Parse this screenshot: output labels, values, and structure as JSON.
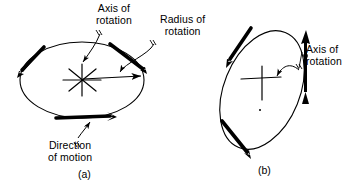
{
  "figure": {
    "panels": [
      {
        "id": "a",
        "caption": "(a)",
        "labels": [
          {
            "name": "axis-of-rotation",
            "text": "Axis of\nrotation"
          },
          {
            "name": "radius-of-rotation",
            "text": "Radius of\nrotation"
          },
          {
            "name": "direction-of-motion",
            "text": "Direction\nof motion"
          }
        ]
      },
      {
        "id": "b",
        "caption": "(b)",
        "labels": [
          {
            "name": "axis-of-rotation",
            "text": "Axis of\nrotation"
          }
        ]
      }
    ]
  },
  "colors": {
    "ink": "#000000",
    "background": "#ffffff"
  }
}
